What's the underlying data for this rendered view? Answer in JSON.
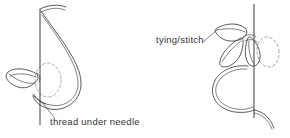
{
  "figure": {
    "background_color": "#ffffff",
    "ink_color": "#3b3b44",
    "dash_color": "#8c8c96",
    "text_color": "#33333b",
    "width": 290,
    "height": 138
  },
  "labels": {
    "thread_under_needle": "thread  under  needle",
    "tying_stitch": "tying/stitch"
  },
  "diagrams": [
    {
      "id": "left-figure",
      "name": "thread-under-needle-figure",
      "caption": "thread  under  needle",
      "parts": [
        "needle",
        "thread-loop",
        "detached-chain-petal",
        "dashed-guide-ellipse",
        "leader-line"
      ]
    },
    {
      "id": "right-figure",
      "name": "tying-stitch-figure",
      "caption": "tying/stitch",
      "parts": [
        "needle",
        "thread-loop",
        "upper-petal",
        "left-petal",
        "right-petal",
        "dashed-guide-ellipse",
        "thread-tail",
        "leader-line"
      ]
    }
  ]
}
